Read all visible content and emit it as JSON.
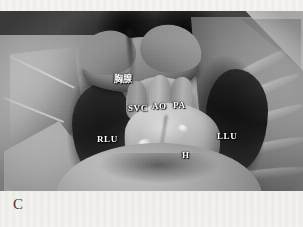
{
  "figure": {
    "panel_letter": "C",
    "caption_present": false,
    "modality": "anatomical-dissection-photograph",
    "view": "anterior thoracic cavity, sternum removed",
    "color_mode": "grayscale"
  },
  "labels": [
    {
      "id": "thymus",
      "text": "胸腺",
      "meaning": "thymus",
      "x": 114,
      "y": 64,
      "font_size": 9,
      "script": "cjk",
      "color": "#ffffff"
    },
    {
      "id": "svc",
      "text": "SVC",
      "meaning": "superior vena cava",
      "x": 128,
      "y": 93,
      "font_size": 9,
      "script": "latin",
      "color": "#ffffff"
    },
    {
      "id": "ao",
      "text": "AO",
      "meaning": "aorta",
      "x": 152,
      "y": 91,
      "font_size": 9,
      "script": "latin",
      "color": "#ffffff"
    },
    {
      "id": "pa",
      "text": "PA",
      "meaning": "pulmonary artery",
      "x": 173,
      "y": 90,
      "font_size": 9,
      "script": "latin",
      "color": "#ffffff"
    },
    {
      "id": "rlu",
      "text": "RLU",
      "meaning": "right lung upper lobe",
      "x": 97,
      "y": 124,
      "font_size": 9,
      "script": "latin",
      "color": "#ffffff"
    },
    {
      "id": "llu",
      "text": "LLU",
      "meaning": "left lung upper lobe",
      "x": 217,
      "y": 121,
      "font_size": 9,
      "script": "latin",
      "color": "#ffffff"
    },
    {
      "id": "h",
      "text": "H",
      "meaning": "heart",
      "x": 182,
      "y": 140,
      "font_size": 9,
      "script": "latin",
      "color": "#ffffff"
    }
  ],
  "colors": {
    "paper_background": "#f4f3f0",
    "photo_mid_tone": "#8a857e",
    "photo_highlight": "#e8e5df",
    "photo_shadow": "#1a1817",
    "label_text": "#ffffff",
    "panel_letter_text": "#3c3a37"
  }
}
